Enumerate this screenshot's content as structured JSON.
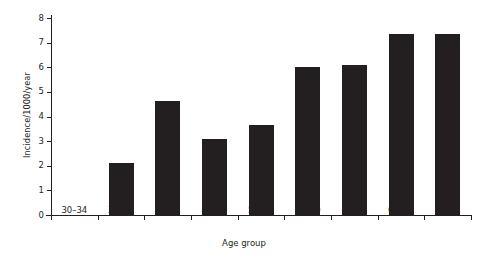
{
  "chart_data": {
    "type": "bar",
    "title": "",
    "subtitle": "",
    "xlabel": "Age group",
    "ylabel": "Incidence/1000/year",
    "categories": [
      "30–34",
      "35–39",
      "40–44",
      "45–49",
      "50–54",
      "55–59",
      "60–64",
      "65–69",
      "70–74"
    ],
    "values": [
      0,
      2.1,
      4.65,
      3.1,
      3.65,
      6.0,
      6.1,
      7.35,
      7.35
    ],
    "ylim": [
      0,
      8
    ],
    "yticks": [
      0,
      1,
      2,
      3,
      4,
      5,
      6,
      7,
      8
    ],
    "ytick_labels": [
      "0",
      "1",
      "2",
      "3",
      "4",
      "5",
      "6",
      "7",
      "8"
    ],
    "grid": false,
    "legend": null,
    "legend_position": "none",
    "bar_color": "#231f20",
    "axis_color": "#231f20",
    "background_color": "#ffffff",
    "series": [
      {
        "name": "Incidence",
        "values": [
          0,
          2.1,
          4.65,
          3.1,
          3.65,
          6.0,
          6.1,
          7.35,
          7.35
        ]
      }
    ]
  }
}
